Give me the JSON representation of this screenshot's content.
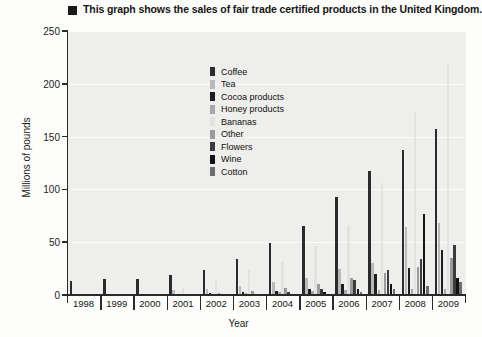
{
  "title": {
    "text": "This graph shows the sales of fair trade certified products in the United Kingdom.",
    "bullet": "square-bullet"
  },
  "axes": {
    "ylabel": "Millions of pounds",
    "xlabel": "Year",
    "yticks": [
      "0",
      "50",
      "100",
      "150",
      "200",
      "250"
    ]
  },
  "legend": {
    "position": "inside-top-left",
    "items": [
      {
        "label": "Coffee",
        "color": "#2b2b2b"
      },
      {
        "label": "Tea",
        "color": "#b9b9b9"
      },
      {
        "label": "Cocoa products",
        "color": "#1e1e1e"
      },
      {
        "label": "Honey products",
        "color": "#a8a8a8"
      },
      {
        "label": "Bananas",
        "color": "#e2e2e0"
      },
      {
        "label": "Other",
        "color": "#9b9b9b"
      },
      {
        "label": "Flowers",
        "color": "#3c3c3c"
      },
      {
        "label": "Wine",
        "color": "#121212"
      },
      {
        "label": "Cotton",
        "color": "#6e6e6e"
      }
    ]
  },
  "chart_data": {
    "type": "bar",
    "title": "This graph shows the sales of fair trade certified products in the United Kingdom.",
    "xlabel": "Year",
    "ylabel": "Millions of pounds",
    "ylim": [
      0,
      250
    ],
    "ytick_interval": 50,
    "grid": true,
    "categories": [
      "1998",
      "1999",
      "2000",
      "2001",
      "2002",
      "2003",
      "2004",
      "2005",
      "2006",
      "2007",
      "2008",
      "2009"
    ],
    "series": [
      {
        "name": "Coffee",
        "color": "#2b2b2b",
        "values": [
          13,
          15,
          15,
          19,
          24,
          34,
          49,
          65,
          93,
          117,
          137,
          157
        ]
      },
      {
        "name": "Tea",
        "color": "#b9b9b9",
        "values": [
          0,
          0,
          0,
          5,
          6,
          9,
          12,
          16,
          25,
          30,
          64,
          68
        ]
      },
      {
        "name": "Cocoa products",
        "color": "#1e1e1e",
        "values": [
          0,
          0,
          0,
          1,
          2,
          3,
          4,
          6,
          10,
          20,
          26,
          43
        ]
      },
      {
        "name": "Honey products",
        "color": "#a8a8a8",
        "values": [
          0,
          0,
          0,
          0,
          1,
          2,
          3,
          4,
          5,
          5,
          6,
          6
        ]
      },
      {
        "name": "Bananas",
        "color": "#e2e2e0",
        "values": [
          0,
          0,
          0,
          7,
          13,
          24,
          31,
          46,
          66,
          106,
          173,
          218
        ]
      },
      {
        "name": "Other",
        "color": "#9b9b9b",
        "values": [
          0,
          0,
          0,
          0,
          2,
          4,
          7,
          10,
          16,
          21,
          27,
          35
        ]
      },
      {
        "name": "Flowers",
        "color": "#3c3c3c",
        "values": [
          0,
          0,
          0,
          0,
          0,
          1,
          3,
          6,
          14,
          24,
          34,
          47
        ]
      },
      {
        "name": "Wine",
        "color": "#121212",
        "values": [
          0,
          0,
          0,
          0,
          0,
          0,
          1,
          3,
          6,
          10,
          77,
          16
        ]
      },
      {
        "name": "Cotton",
        "color": "#6e6e6e",
        "values": [
          0,
          0,
          0,
          0,
          0,
          0,
          0,
          1,
          3,
          6,
          9,
          12
        ]
      }
    ]
  }
}
